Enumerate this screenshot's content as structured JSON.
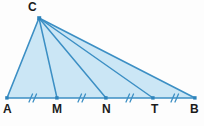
{
  "figure": {
    "type": "geometry-diagram",
    "background_color": "#fdfdfd",
    "line_color": "#3c8fc4",
    "fill_color": "#cbe6f5",
    "point_color": "#2d83bb",
    "label_color": "#1b1b1b",
    "labels": {
      "A": "A",
      "M": "M",
      "N": "N",
      "T": "T",
      "B": "B",
      "C": "C"
    },
    "points": [
      {
        "name": "A",
        "label": "A",
        "x": 7,
        "y": 98
      },
      {
        "name": "M",
        "label": "M",
        "x": 57,
        "y": 98
      },
      {
        "name": "N",
        "label": "N",
        "x": 106,
        "y": 98
      },
      {
        "name": "T",
        "label": "T",
        "x": 153,
        "y": 98
      },
      {
        "name": "B",
        "label": "B",
        "x": 195,
        "y": 98
      },
      {
        "name": "C",
        "label": "C",
        "x": 39,
        "y": 18
      }
    ],
    "segments": [
      {
        "name": "base-AB",
        "from": "A",
        "to": "B"
      },
      {
        "name": "side-CA",
        "from": "C",
        "to": "A"
      },
      {
        "name": "side-CB",
        "from": "C",
        "to": "B"
      },
      {
        "name": "cevian-CM",
        "from": "C",
        "to": "M"
      },
      {
        "name": "cevian-CN",
        "from": "C",
        "to": "N"
      },
      {
        "name": "cevian-CT",
        "from": "C",
        "to": "T"
      }
    ],
    "tick_marks": [
      {
        "name": "tick-AM",
        "x": 31,
        "y": 98,
        "count": 2
      },
      {
        "name": "tick-MN",
        "x": 80,
        "y": 98,
        "count": 2
      },
      {
        "name": "tick-NT",
        "x": 128,
        "y": 98,
        "count": 2
      },
      {
        "name": "tick-TB",
        "x": 173,
        "y": 98,
        "count": 2
      }
    ]
  }
}
